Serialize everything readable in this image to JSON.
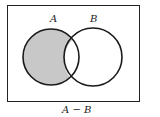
{
  "diagram": {
    "type": "venn",
    "sets": [
      {
        "label": "A"
      },
      {
        "label": "B"
      }
    ],
    "shaded_region": "A minus B",
    "caption": "A − B",
    "colors": {
      "shade": "#c8c8c8",
      "stroke": "#1a1a1a",
      "background": "#ffffff"
    }
  }
}
